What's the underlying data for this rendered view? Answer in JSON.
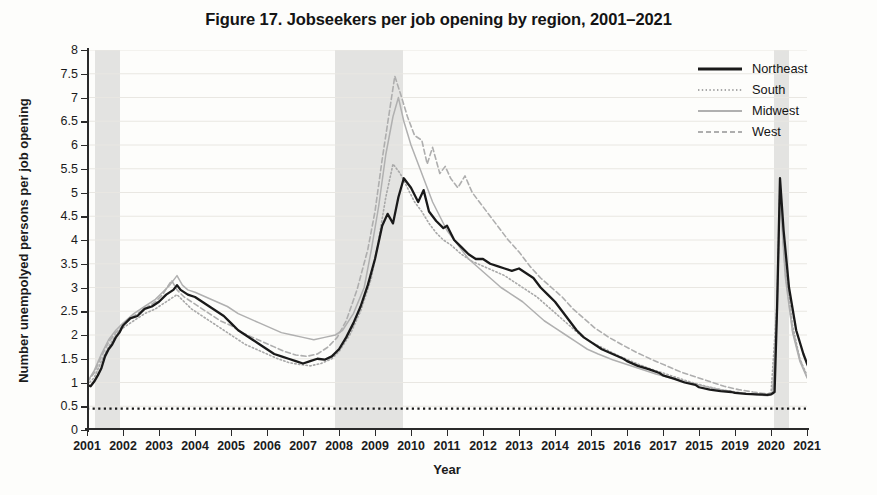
{
  "title": "Figure 17.  Jobseekers per job opening by region, 2001–2021",
  "axis": {
    "ylabel": "Number unempolyed persons per job opening",
    "xlabel": "Year"
  },
  "legend": {
    "items": [
      {
        "label": "Northeast",
        "style": "solid-dark",
        "color": "#1a1a1a"
      },
      {
        "label": "South",
        "style": "dotted-light",
        "color": "#a8a8a8"
      },
      {
        "label": "Midwest",
        "style": "solid-light",
        "color": "#b0b0b0"
      },
      {
        "label": "West",
        "style": "dashed-light",
        "color": "#aeaeae"
      }
    ]
  },
  "chart_data": {
    "type": "line",
    "title": "Figure 17.  Jobseekers per job opening by region, 2001–2021",
    "xlabel": "Year",
    "ylabel": "Number unempolyed persons per job opening",
    "xlim": [
      2001,
      2021
    ],
    "ylim": [
      0,
      8
    ],
    "ytick_labels": [
      "0",
      "0.5",
      "1",
      "1.5",
      "2",
      "2.5",
      "3",
      "3.5",
      "4",
      "4.5",
      "5",
      "5.5",
      "6",
      "6.5",
      "7",
      "7.5",
      "8"
    ],
    "ytick_values": [
      0,
      0.5,
      1,
      1.5,
      2,
      2.5,
      3,
      3.5,
      4,
      4.5,
      5,
      5.5,
      6,
      6.5,
      7,
      7.5,
      8
    ],
    "xtick_labels": [
      "2001",
      "2002",
      "2003",
      "2004",
      "2005",
      "2006",
      "2007",
      "2008",
      "2009",
      "2010",
      "2011",
      "2012",
      "2013",
      "2014",
      "2015",
      "2016",
      "2017",
      "2015",
      "2019",
      "2020",
      "2021"
    ],
    "xtick_values": [
      2001,
      2002,
      2003,
      2004,
      2005,
      2006,
      2007,
      2008,
      2009,
      2010,
      2011,
      2012,
      2013,
      2014,
      2015,
      2016,
      2017,
      2018,
      2019,
      2020,
      2021
    ],
    "grid": "horizontal",
    "legend_position": "top-right",
    "reference_line": {
      "y": 0.45,
      "style": "dotted",
      "color": "#1a1a1a"
    },
    "shaded_bands": [
      {
        "label": "recession",
        "x0": 2001.22,
        "x1": 2001.92
      },
      {
        "label": "recession",
        "x0": 2007.9,
        "x1": 2009.78
      },
      {
        "label": "recession",
        "x0": 2020.08,
        "x1": 2020.5
      }
    ],
    "series": [
      {
        "name": "Northeast",
        "color": "#1a1a1a",
        "style": "solid-dark",
        "x": [
          2001.0,
          2001.1,
          2001.2,
          2001.3,
          2001.4,
          2001.5,
          2001.6,
          2001.7,
          2001.8,
          2001.9,
          2002.0,
          2002.2,
          2002.4,
          2002.6,
          2002.8,
          2003.0,
          2003.2,
          2003.4,
          2003.5,
          2003.6,
          2003.8,
          2004.0,
          2004.2,
          2004.4,
          2004.6,
          2004.8,
          2005.0,
          2005.2,
          2005.4,
          2005.6,
          2005.8,
          2006.0,
          2006.2,
          2006.4,
          2006.6,
          2006.8,
          2007.0,
          2007.2,
          2007.4,
          2007.6,
          2007.8,
          2008.0,
          2008.2,
          2008.4,
          2008.6,
          2008.8,
          2009.0,
          2009.2,
          2009.35,
          2009.5,
          2009.65,
          2009.8,
          2010.0,
          2010.2,
          2010.35,
          2010.5,
          2010.7,
          2010.9,
          2011.0,
          2011.2,
          2011.4,
          2011.6,
          2011.8,
          2012.0,
          2012.2,
          2012.4,
          2012.6,
          2012.8,
          2013.0,
          2013.2,
          2013.4,
          2013.6,
          2013.8,
          2014.0,
          2014.2,
          2014.4,
          2014.6,
          2014.8,
          2015.0,
          2015.3,
          2015.6,
          2015.9,
          2016.0,
          2016.3,
          2016.6,
          2016.9,
          2017.0,
          2017.3,
          2017.6,
          2017.9,
          2018.0,
          2018.3,
          2018.6,
          2018.9,
          2019.0,
          2019.3,
          2019.6,
          2019.9,
          2020.0,
          2020.1,
          2020.17,
          2020.25,
          2020.35,
          2020.5,
          2020.7,
          2020.9,
          2021.0,
          2021.2,
          2021.4,
          2021.6
        ],
        "y": [
          0.95,
          0.92,
          1.02,
          1.15,
          1.3,
          1.55,
          1.7,
          1.8,
          1.95,
          2.05,
          2.2,
          2.35,
          2.4,
          2.55,
          2.6,
          2.7,
          2.85,
          2.95,
          3.05,
          2.95,
          2.85,
          2.8,
          2.7,
          2.6,
          2.5,
          2.4,
          2.25,
          2.1,
          2.0,
          1.9,
          1.8,
          1.7,
          1.6,
          1.55,
          1.5,
          1.45,
          1.4,
          1.45,
          1.5,
          1.48,
          1.55,
          1.7,
          1.95,
          2.25,
          2.6,
          3.05,
          3.6,
          4.3,
          4.55,
          4.35,
          4.9,
          5.3,
          5.1,
          4.8,
          5.05,
          4.6,
          4.4,
          4.25,
          4.3,
          4.0,
          3.85,
          3.7,
          3.6,
          3.6,
          3.5,
          3.45,
          3.4,
          3.35,
          3.4,
          3.3,
          3.2,
          3.0,
          2.85,
          2.7,
          2.5,
          2.3,
          2.1,
          1.95,
          1.85,
          1.7,
          1.6,
          1.5,
          1.45,
          1.35,
          1.28,
          1.2,
          1.15,
          1.08,
          1.0,
          0.95,
          0.9,
          0.85,
          0.82,
          0.8,
          0.78,
          0.76,
          0.75,
          0.74,
          0.75,
          0.8,
          2.6,
          5.3,
          4.2,
          3.0,
          2.1,
          1.6,
          1.4,
          1.05,
          0.85,
          0.7
        ]
      },
      {
        "name": "South",
        "color": "#a8a8a8",
        "style": "dotted-light",
        "x": [
          2001.0,
          2001.2,
          2001.4,
          2001.6,
          2001.8,
          2002.0,
          2002.3,
          2002.6,
          2002.9,
          2003.0,
          2003.3,
          2003.5,
          2003.7,
          2003.9,
          2004.2,
          2004.5,
          2004.8,
          2005.1,
          2005.4,
          2005.7,
          2006.0,
          2006.3,
          2006.6,
          2006.9,
          2007.2,
          2007.5,
          2007.8,
          2008.0,
          2008.3,
          2008.6,
          2008.9,
          2009.1,
          2009.3,
          2009.5,
          2009.7,
          2009.9,
          2010.1,
          2010.3,
          2010.5,
          2010.7,
          2010.9,
          2011.1,
          2011.4,
          2011.7,
          2012.0,
          2012.3,
          2012.6,
          2012.9,
          2013.2,
          2013.5,
          2013.8,
          2014.1,
          2014.4,
          2014.7,
          2015.0,
          2015.4,
          2015.8,
          2016.2,
          2016.6,
          2017.0,
          2017.4,
          2017.8,
          2018.2,
          2018.6,
          2019.0,
          2019.4,
          2019.8,
          2020.0,
          2020.17,
          2020.25,
          2020.4,
          2020.6,
          2020.8,
          2021.0,
          2021.3,
          2021.6
        ],
        "y": [
          0.95,
          1.1,
          1.45,
          1.75,
          2.0,
          2.15,
          2.3,
          2.45,
          2.55,
          2.6,
          2.75,
          2.85,
          2.7,
          2.55,
          2.4,
          2.25,
          2.1,
          1.95,
          1.8,
          1.7,
          1.6,
          1.5,
          1.42,
          1.38,
          1.35,
          1.4,
          1.5,
          1.65,
          2.0,
          2.5,
          3.2,
          4.0,
          4.9,
          5.6,
          5.4,
          5.1,
          4.8,
          4.6,
          4.35,
          4.15,
          4.0,
          3.9,
          3.7,
          3.55,
          3.45,
          3.35,
          3.25,
          3.1,
          2.95,
          2.8,
          2.6,
          2.4,
          2.2,
          2.0,
          1.85,
          1.7,
          1.55,
          1.42,
          1.3,
          1.2,
          1.1,
          1.0,
          0.92,
          0.85,
          0.8,
          0.76,
          0.74,
          0.76,
          2.7,
          5.2,
          3.4,
          2.2,
          1.5,
          1.15,
          0.8,
          0.6
        ]
      },
      {
        "name": "Midwest",
        "color": "#b0b0b0",
        "style": "solid-light",
        "x": [
          2001.0,
          2001.2,
          2001.4,
          2001.6,
          2001.8,
          2002.0,
          2002.3,
          2002.6,
          2002.9,
          2003.1,
          2003.3,
          2003.5,
          2003.65,
          2003.8,
          2004.0,
          2004.3,
          2004.6,
          2004.9,
          2005.2,
          2005.5,
          2005.8,
          2006.1,
          2006.4,
          2006.7,
          2007.0,
          2007.3,
          2007.6,
          2007.9,
          2008.1,
          2008.4,
          2008.7,
          2008.9,
          2009.1,
          2009.3,
          2009.5,
          2009.65,
          2009.8,
          2010.0,
          2010.2,
          2010.4,
          2010.6,
          2010.8,
          2011.0,
          2011.3,
          2011.6,
          2011.9,
          2012.2,
          2012.5,
          2012.8,
          2013.1,
          2013.4,
          2013.7,
          2014.0,
          2014.3,
          2014.6,
          2014.9,
          2015.2,
          2015.6,
          2016.0,
          2016.4,
          2016.8,
          2017.2,
          2017.6,
          2018.0,
          2018.4,
          2018.8,
          2019.2,
          2019.6,
          2019.9,
          2020.05,
          2020.17,
          2020.25,
          2020.4,
          2020.6,
          2020.8,
          2021.0,
          2021.3,
          2021.6
        ],
        "y": [
          1.0,
          1.25,
          1.6,
          1.9,
          2.1,
          2.25,
          2.45,
          2.6,
          2.75,
          2.9,
          3.05,
          3.25,
          3.05,
          2.95,
          2.9,
          2.8,
          2.7,
          2.6,
          2.45,
          2.35,
          2.25,
          2.15,
          2.05,
          2.0,
          1.95,
          1.9,
          1.95,
          2.0,
          2.1,
          2.45,
          3.0,
          3.8,
          4.7,
          5.8,
          6.6,
          7.0,
          6.5,
          6.0,
          5.6,
          5.2,
          4.8,
          4.5,
          4.2,
          3.9,
          3.6,
          3.4,
          3.2,
          3.0,
          2.85,
          2.7,
          2.5,
          2.3,
          2.15,
          2.0,
          1.85,
          1.7,
          1.6,
          1.48,
          1.38,
          1.28,
          1.18,
          1.1,
          1.02,
          0.95,
          0.88,
          0.82,
          0.78,
          0.74,
          0.72,
          0.75,
          2.5,
          4.9,
          3.2,
          2.05,
          1.45,
          1.1,
          0.78,
          0.58
        ]
      },
      {
        "name": "West",
        "color": "#aeaeae",
        "style": "dashed-light",
        "x": [
          2001.0,
          2001.2,
          2001.4,
          2001.6,
          2001.8,
          2002.0,
          2002.3,
          2002.6,
          2002.9,
          2003.1,
          2003.35,
          2003.5,
          2003.7,
          2003.9,
          2004.1,
          2004.4,
          2004.7,
          2005.0,
          2005.3,
          2005.6,
          2005.9,
          2006.2,
          2006.5,
          2006.8,
          2007.1,
          2007.4,
          2007.7,
          2007.95,
          2008.2,
          2008.5,
          2008.8,
          2009.0,
          2009.2,
          2009.4,
          2009.55,
          2009.7,
          2009.9,
          2010.1,
          2010.3,
          2010.45,
          2010.6,
          2010.8,
          2010.95,
          2011.1,
          2011.3,
          2011.5,
          2011.7,
          2011.9,
          2012.1,
          2012.4,
          2012.7,
          2013.0,
          2013.3,
          2013.6,
          2013.9,
          2014.2,
          2014.5,
          2014.8,
          2015.1,
          2015.5,
          2015.9,
          2016.3,
          2016.7,
          2017.1,
          2017.5,
          2017.9,
          2018.3,
          2018.7,
          2019.1,
          2019.5,
          2019.9,
          2020.05,
          2020.17,
          2020.25,
          2020.4,
          2020.6,
          2020.8,
          2021.0,
          2021.3,
          2021.6
        ],
        "y": [
          1.0,
          1.2,
          1.55,
          1.85,
          2.05,
          2.2,
          2.4,
          2.55,
          2.7,
          2.85,
          3.15,
          2.95,
          2.8,
          2.7,
          2.6,
          2.45,
          2.3,
          2.2,
          2.05,
          1.95,
          1.85,
          1.75,
          1.65,
          1.58,
          1.55,
          1.6,
          1.75,
          1.95,
          2.3,
          2.95,
          3.8,
          4.6,
          5.7,
          6.7,
          7.45,
          7.1,
          6.6,
          6.2,
          6.1,
          5.6,
          5.95,
          5.4,
          5.55,
          5.3,
          5.1,
          5.35,
          5.0,
          4.8,
          4.6,
          4.3,
          4.0,
          3.75,
          3.45,
          3.2,
          3.0,
          2.8,
          2.55,
          2.35,
          2.15,
          1.95,
          1.78,
          1.62,
          1.48,
          1.35,
          1.22,
          1.12,
          1.02,
          0.92,
          0.85,
          0.8,
          0.76,
          0.8,
          2.6,
          5.1,
          3.3,
          2.1,
          1.5,
          1.12,
          0.82,
          0.62
        ]
      }
    ]
  }
}
